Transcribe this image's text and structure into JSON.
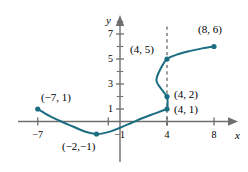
{
  "figure": {
    "kind": "cartesian-graph",
    "colors": {
      "curve": "#1b6e81",
      "point": "#1b6e81",
      "axis": "#6f6f6f",
      "dashed": "#3a3a3a",
      "text": "#000000",
      "background": "#ffffff"
    }
  },
  "axes": {
    "x_axis_label": "x",
    "y_axis_label": "y",
    "x_ticks": [
      {
        "value": -7,
        "label": "−7"
      },
      {
        "value": -1,
        "label": "−1"
      },
      {
        "value": 4,
        "label": "4"
      },
      {
        "value": 8,
        "label": "8"
      }
    ],
    "y_ticks": [
      {
        "value": 1,
        "label": "1"
      },
      {
        "value": 3,
        "label": "3"
      },
      {
        "value": 5,
        "label": "5"
      },
      {
        "value": 7,
        "label": "7"
      }
    ],
    "y_minor_ticks": [
      2,
      4,
      6,
      8
    ],
    "xlim": [
      -9,
      10
    ],
    "ylim": [
      -2.5,
      8.5
    ]
  },
  "chart_data": {
    "type": "line",
    "title": "",
    "xlabel": "x",
    "ylabel": "y",
    "xlim": [
      -9,
      10
    ],
    "ylim": [
      -2.5,
      8.5
    ],
    "grid": false,
    "legend": null,
    "series": [
      {
        "name": "curve",
        "style": "solid",
        "color": "#1b6e81",
        "description": "Non-function curve: parabola-like left branch rising from (-7,1) through minimum near (-2,-1), up to (4,1), then an S-shaped vertical section through (4,2) bulging left to about x=3.1 near y=3.3, back to (4,5), then gently rising to (8,6).",
        "points": [
          [
            -7,
            1
          ],
          [
            -6,
            0.45
          ],
          [
            -5,
            0.0
          ],
          [
            -4,
            -0.4
          ],
          [
            -3,
            -0.8
          ],
          [
            -2,
            -1
          ],
          [
            -1,
            -0.85
          ],
          [
            0,
            -0.5
          ],
          [
            1,
            -0.1
          ],
          [
            2,
            0.3
          ],
          [
            3,
            0.65
          ],
          [
            3.7,
            0.9
          ],
          [
            4,
            1
          ],
          [
            4.05,
            1.5
          ],
          [
            4,
            2
          ],
          [
            3.6,
            2.5
          ],
          [
            3.1,
            3.3
          ],
          [
            3.5,
            4.3
          ],
          [
            4,
            5
          ],
          [
            5,
            5.4
          ],
          [
            6,
            5.65
          ],
          [
            7,
            5.85
          ],
          [
            8,
            6
          ]
        ]
      }
    ],
    "marked_points": [
      {
        "x": -7,
        "y": 1,
        "label": "(−7, 1)",
        "label_pos": "above-right"
      },
      {
        "x": -2,
        "y": -1,
        "label": "(−2,−1)",
        "label_pos": "below"
      },
      {
        "x": 4,
        "y": 1,
        "label": "(4, 1)",
        "label_pos": "right"
      },
      {
        "x": 4,
        "y": 2,
        "label": "(4, 2)",
        "label_pos": "right"
      },
      {
        "x": 4,
        "y": 5,
        "label": "(4, 5)",
        "label_pos": "left"
      },
      {
        "x": 8,
        "y": 6,
        "label": "(8, 6)",
        "label_pos": "above"
      }
    ],
    "annotations": [
      {
        "type": "vertical-dashed-line",
        "x": 4,
        "y_from": -0.4,
        "y_to": 7.6
      }
    ]
  }
}
